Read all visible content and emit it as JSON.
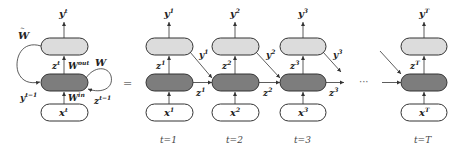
{
  "diagram": {
    "type": "rnn-unrolled",
    "equals_sign": "=",
    "ellipsis": "···",
    "folded": {
      "output": {
        "base": "y",
        "sup": "t"
      },
      "input": {
        "base": "x",
        "sup": "t"
      },
      "hidden": {
        "base": "z",
        "sup": "t"
      },
      "weights": {
        "w_tilde": {
          "base": "W",
          "accent": "~"
        },
        "w_out": {
          "base": "W",
          "sup": "out"
        },
        "w_in": {
          "base": "W",
          "sup": "in"
        },
        "w": {
          "base": "W"
        }
      },
      "feedback_y": {
        "base": "y",
        "sup": "t−1"
      },
      "feedback_z": {
        "base": "z",
        "sup": "t−1"
      }
    },
    "steps": [
      {
        "t_label": "t=1",
        "y": {
          "base": "y",
          "sup": "1"
        },
        "z": {
          "base": "z",
          "sup": "1"
        },
        "x": {
          "base": "x",
          "sup": "1"
        },
        "out_y": {
          "base": "y",
          "sup": "1"
        },
        "out_z": {
          "base": "z",
          "sup": "1"
        }
      },
      {
        "t_label": "t=2",
        "y": {
          "base": "y",
          "sup": "2"
        },
        "z": {
          "base": "z",
          "sup": "2"
        },
        "x": {
          "base": "x",
          "sup": "2"
        },
        "out_y": {
          "base": "y",
          "sup": "2"
        },
        "out_z": {
          "base": "z",
          "sup": "2"
        }
      },
      {
        "t_label": "t=3",
        "y": {
          "base": "y",
          "sup": "3"
        },
        "z": {
          "base": "z",
          "sup": "3"
        },
        "x": {
          "base": "x",
          "sup": "3"
        },
        "out_y": {
          "base": "y",
          "sup": "3"
        },
        "out_z": {
          "base": "z",
          "sup": "3"
        }
      },
      {
        "t_label": "t=T",
        "y": {
          "base": "y",
          "sup": "T"
        },
        "z": {
          "base": "z",
          "sup": "T"
        },
        "x": {
          "base": "x",
          "sup": "T"
        }
      }
    ],
    "colors": {
      "output_layer": "#dcdcdc",
      "hidden_layer": "#7d7d7d",
      "input_layer": "#ffffff",
      "stroke": "#333333"
    }
  }
}
